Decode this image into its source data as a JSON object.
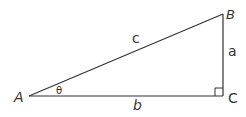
{
  "diagram": {
    "vertices": {
      "A": {
        "label": "A",
        "x": 29,
        "y": 96
      },
      "B": {
        "label": "B",
        "x": 223,
        "y": 14
      },
      "C": {
        "label": "C",
        "x": 223,
        "y": 96
      }
    },
    "sides": {
      "a": {
        "label": "a",
        "between": [
          "B",
          "C"
        ]
      },
      "b": {
        "label": "b",
        "between": [
          "A",
          "C"
        ]
      },
      "c": {
        "label": "c",
        "between": [
          "A",
          "B"
        ]
      }
    },
    "angle": {
      "label": "θ",
      "at": "A"
    },
    "right_angle_marker": {
      "at": "C",
      "size": 8
    },
    "colors": {
      "stroke": "#333333",
      "background": "#ffffff"
    }
  }
}
